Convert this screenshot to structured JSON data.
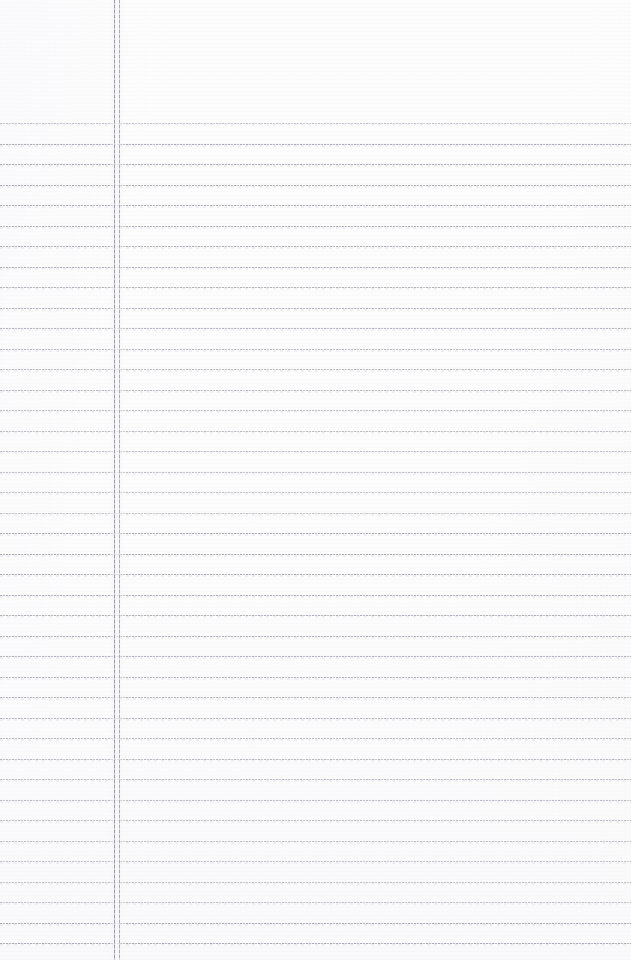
{
  "page": {
    "kind": "lined-notebook-paper",
    "width": 631,
    "height": 960,
    "background_color": "#fdfdfd",
    "content_text": "",
    "is_blank": true
  },
  "ruling": {
    "rule_color": "#a8a8b0",
    "rule_shadow_color": "#e2e2e8",
    "first_rule_y": 123,
    "line_spacing": 20.5,
    "rule_count": 41,
    "rule_left": 0,
    "rule_right": 631,
    "rule_thickness": 1,
    "style": "dotted-scan"
  },
  "margin": {
    "color": "#96969f",
    "secondary_color": "#a0a0aa",
    "x_primary": 114,
    "x_secondary": 119,
    "thickness": 1,
    "top": 0,
    "bottom": 960,
    "count": 2,
    "label": "double vertical margin rule"
  },
  "header_area": {
    "top_blank_height": 123,
    "label": "blank header band above first rule"
  }
}
